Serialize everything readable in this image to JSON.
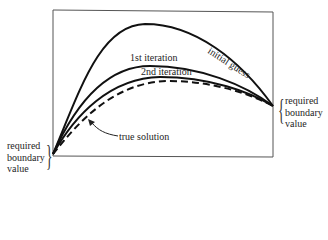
{
  "diagram": {
    "curves": [
      {
        "id": "initial_guess",
        "label": "initial guess",
        "style": "solid"
      },
      {
        "id": "first_iteration",
        "label": "1st iteration",
        "style": "solid"
      },
      {
        "id": "second_iteration",
        "label": "2nd iteration",
        "style": "solid"
      },
      {
        "id": "true_solution",
        "label": "true solution",
        "style": "dashed"
      }
    ],
    "left_boundary": {
      "lines": [
        "required",
        "boundary",
        "value"
      ]
    },
    "right_boundary": {
      "lines": [
        "required",
        "boundary",
        "value"
      ]
    },
    "colors": {
      "line": "#111111",
      "frame": "#444444",
      "background": "#ffffff"
    }
  }
}
